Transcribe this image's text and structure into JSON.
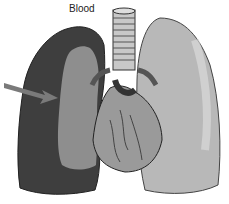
{
  "figure": {
    "label": "Blood"
  },
  "colors": {
    "left_lung": "#3e3e3e",
    "left_lung_region": "#8e8e8e",
    "right_lung": "#b8b8b8",
    "heart": "#9a9a9a",
    "trachea": "#c8c8c8",
    "arrow": "#7a7a7a"
  }
}
